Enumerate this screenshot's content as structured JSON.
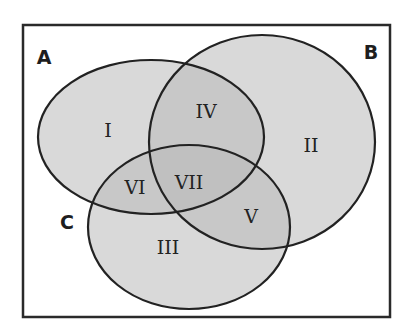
{
  "diagram": {
    "type": "venn",
    "set_count": 3,
    "colors": {
      "background": "#ffffff",
      "frame_stroke": "#2a2a2a",
      "ellipse_fill": "#b9b9b9",
      "ellipse_fill_opacity": 0.55,
      "ellipse_stroke": "#222222",
      "text": "#1e1e1e"
    },
    "sets": [
      {
        "id": "A",
        "label": "A"
      },
      {
        "id": "B",
        "label": "B"
      },
      {
        "id": "C",
        "label": "C"
      }
    ],
    "regions": [
      {
        "id": "I",
        "label": "I",
        "membership": "A only"
      },
      {
        "id": "II",
        "label": "II",
        "membership": "B only"
      },
      {
        "id": "III",
        "label": "III",
        "membership": "C only"
      },
      {
        "id": "IV",
        "label": "IV",
        "membership": "A and B only"
      },
      {
        "id": "V",
        "label": "V",
        "membership": "B and C only"
      },
      {
        "id": "VI",
        "label": "VI",
        "membership": "A and C only"
      },
      {
        "id": "VII",
        "label": "VII",
        "membership": "A, B and C"
      }
    ]
  }
}
